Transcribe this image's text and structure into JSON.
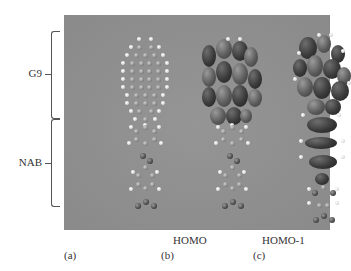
{
  "figure": {
    "panel_background": "#8e8e8e",
    "side_labels": {
      "g9": "G9",
      "nab": "NAB"
    },
    "orbital_labels": {
      "b": "HOMO",
      "c": "HOMO-1"
    },
    "panel_labels": {
      "a": "(a)",
      "b": "(b)",
      "c": "(c)"
    },
    "columns": [
      {
        "id": "a",
        "content": "ball-and-stick molecular structure (G9 graphene fragment + NAB)"
      },
      {
        "id": "b",
        "content": "HOMO isosurface localized on G9"
      },
      {
        "id": "c",
        "content": "HOMO-1 isosurface spanning G9 and upper NAB"
      }
    ]
  }
}
